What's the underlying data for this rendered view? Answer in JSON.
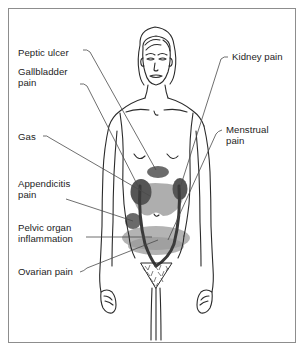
{
  "diagram": {
    "frame_color": "#8d8d8d",
    "background_color": "#ffffff",
    "line_color": "#2b2b2b",
    "leader_line_color": "#4a4a4a"
  },
  "labels": {
    "peptic_ulcer": "Peptic ulcer",
    "gallbladder_pain_line1": "Gallbladder",
    "gallbladder_pain_line2": "pain",
    "gas": "Gas",
    "appendicitis_line1": "Appendicitis",
    "appendicitis_line2": "pain",
    "pelvic_organ_line1": "Pelvic organ",
    "pelvic_organ_line2": "inflammation",
    "ovarian_pain": "Ovarian pain",
    "kidney_pain": "Kidney pain",
    "menstrual_line1": "Menstrual",
    "menstrual_line2": "pain"
  },
  "pain_zones": [
    {
      "name": "peptic-ulcer-zone",
      "label": "Peptic ulcer",
      "shape": "ellipse",
      "color": "#6e6e6e",
      "side": "center-upper-abdomen"
    },
    {
      "name": "gallbladder-zone",
      "label": "Gallbladder pain",
      "shape": "ellipse",
      "color": "#5a5a5a",
      "side": "right-upper-abdomen"
    },
    {
      "name": "gas-zone",
      "label": "Gas",
      "shape": "broad-band",
      "color": "#9e9e9e",
      "side": "mid-abdomen"
    },
    {
      "name": "appendicitis-zone",
      "label": "Appendicitis pain",
      "shape": "ellipse",
      "color": "#6a6a6a",
      "side": "right-lower-abdomen"
    },
    {
      "name": "pelvic-organ-zone",
      "label": "Pelvic organ inflammation",
      "shape": "wide-ellipse",
      "color": "#a5a5a5",
      "side": "pelvis"
    },
    {
      "name": "ovarian-zone",
      "label": "Ovarian pain",
      "shape": "wide-ellipse",
      "color": "#9a9a9a",
      "side": "lower-pelvis"
    },
    {
      "name": "kidney-zone",
      "label": "Kidney pain",
      "shape": "ellipse",
      "color": "#5a5a5a",
      "side": "left-flank"
    },
    {
      "name": "menstrual-zone",
      "label": "Menstrual pain",
      "shape": "ellipse",
      "color": "#9a9a9a",
      "side": "lower-central-pelvis"
    }
  ]
}
